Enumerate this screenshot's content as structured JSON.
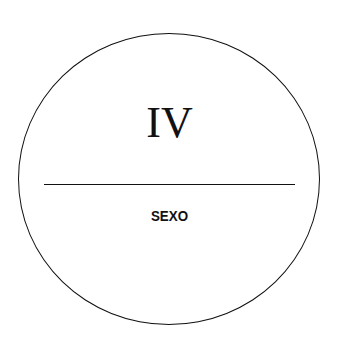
{
  "badge": {
    "numeral": "IV",
    "label": "SEXO"
  },
  "colors": {
    "stroke": "#111111",
    "background": "#ffffff"
  }
}
